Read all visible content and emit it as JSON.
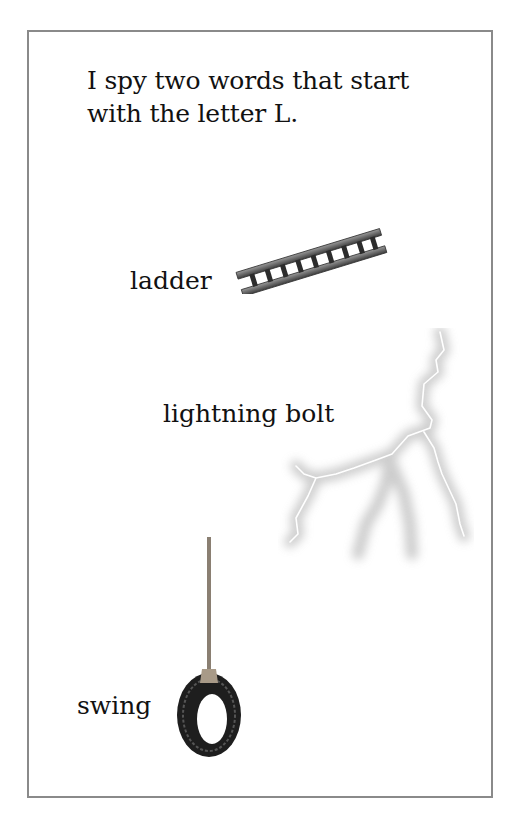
{
  "page": {
    "prompt_lines": [
      "I spy two words that start",
      "with the letter L."
    ],
    "items": [
      {
        "label": "ladder",
        "icon": "ladder-icon"
      },
      {
        "label": "lightning bolt",
        "icon": "lightning-bolt-icon"
      },
      {
        "label": "swing",
        "icon": "tire-swing-icon"
      }
    ]
  },
  "colors": {
    "frame_border": "#8a8a8a",
    "text": "#111111",
    "background": "#ffffff"
  }
}
